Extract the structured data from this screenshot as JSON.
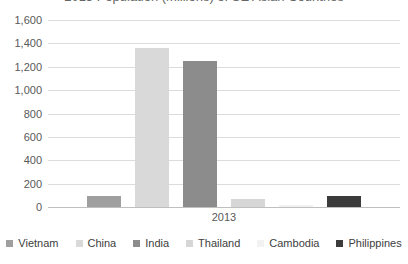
{
  "chart_data": {
    "type": "bar",
    "title": "2013 Population (millions) of SE Asian Countries",
    "title_clipped_at_top": true,
    "categories": [
      "2013"
    ],
    "series": [
      {
        "name": "Vietnam",
        "values": [
          90
        ],
        "color": "#9f9f9f"
      },
      {
        "name": "China",
        "values": [
          1357
        ],
        "color": "#d9d9d9"
      },
      {
        "name": "India",
        "values": [
          1252
        ],
        "color": "#8c8c8c"
      },
      {
        "name": "Thailand",
        "values": [
          67
        ],
        "color": "#d6d6d6"
      },
      {
        "name": "Cambodia",
        "values": [
          15
        ],
        "color": "#f2f2f2"
      },
      {
        "name": "Philippines",
        "values": [
          98
        ],
        "color": "#3b3b3b"
      }
    ],
    "xlabel": "",
    "ylabel": "",
    "ylim": [
      0,
      1600
    ],
    "y_tick_step": 200,
    "y_tick_labels": [
      "0",
      "200",
      "400",
      "600",
      "800",
      "1,000",
      "1,200",
      "1,400",
      "1,600"
    ],
    "grid": true,
    "legend_position": "bottom"
  },
  "colors": {
    "gridline": "#dcdcdc",
    "axis_line": "#bfbfbf",
    "tick_text": "#595959",
    "legend_text": "#404040",
    "title_text": "#666666",
    "background": "#ffffff"
  }
}
